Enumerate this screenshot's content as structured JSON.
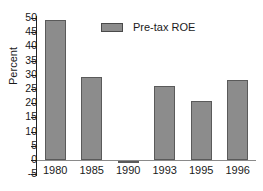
{
  "chart_data": {
    "type": "bar",
    "title": "",
    "xlabel": "",
    "ylabel": "Percent",
    "categories": [
      "1980",
      "1985",
      "1990",
      "1993",
      "1995",
      "1996"
    ],
    "values": [
      49.3,
      29.1,
      -0.6,
      26.2,
      20.8,
      28.2
    ],
    "series": [
      {
        "name": "Pre-tax ROE",
        "values": [
          49.3,
          29.1,
          -0.6,
          26.2,
          20.8,
          28.2
        ]
      }
    ],
    "ylim": [
      -5,
      50
    ],
    "ytick_labels": [
      "50",
      "45",
      "40",
      "35",
      "30",
      "25",
      "20",
      "15",
      "10",
      "5",
      "0",
      "-5"
    ],
    "ytick_values": [
      50,
      45,
      40,
      35,
      30,
      25,
      20,
      15,
      10,
      5,
      0,
      -5
    ],
    "grid": false,
    "legend_position": "top-center",
    "legend": [
      "Pre-tax ROE"
    ],
    "bar_color": "#8c8c8c",
    "bar_edge_color": "#5a5a5a",
    "axis_color": "#222222"
  }
}
